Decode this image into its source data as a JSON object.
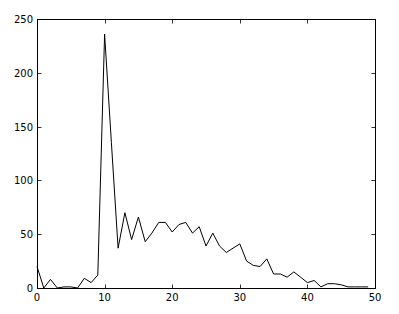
{
  "chart_data": {
    "type": "line",
    "title": "",
    "xlabel": "",
    "ylabel": "",
    "xlim": [
      0,
      50
    ],
    "ylim": [
      0,
      250
    ],
    "grid": false,
    "legend": null,
    "x_ticks": [
      0,
      10,
      20,
      30,
      40,
      50
    ],
    "y_ticks": [
      0,
      50,
      100,
      150,
      200,
      250
    ],
    "x": [
      0,
      1,
      2,
      3,
      4,
      5,
      6,
      7,
      8,
      9,
      10,
      11,
      12,
      13,
      14,
      15,
      16,
      17,
      18,
      19,
      20,
      21,
      22,
      23,
      24,
      25,
      26,
      27,
      28,
      29,
      30,
      31,
      32,
      33,
      34,
      35,
      36,
      37,
      38,
      39,
      40,
      41,
      42,
      43,
      44,
      45,
      46,
      47,
      48,
      49
    ],
    "series": [
      {
        "name": "series-1",
        "color": "#000000",
        "values": [
          20,
          0,
          8,
          0,
          1,
          1,
          0,
          9,
          5,
          12,
          236,
          135,
          37,
          70,
          45,
          66,
          43,
          51,
          61,
          61,
          52,
          59,
          61,
          51,
          57,
          39,
          51,
          39,
          33,
          37,
          41,
          25,
          21,
          20,
          27,
          13,
          13,
          10,
          15,
          10,
          5,
          7,
          1,
          4,
          4,
          3,
          1,
          1,
          1,
          1
        ]
      }
    ]
  },
  "plot": {
    "left": 37,
    "right": 375,
    "top": 19,
    "bottom": 288
  }
}
